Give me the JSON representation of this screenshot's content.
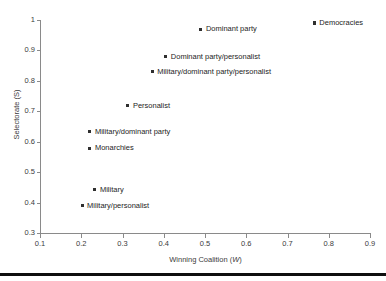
{
  "chart_data": {
    "type": "scatter",
    "title": "",
    "xlabel": "Winning Coalition (W)",
    "xlabel_plain": "Winning Coalition (",
    "xlabel_italic": "W",
    "xlabel_tail": ")",
    "ylabel": "Selectorate (S)",
    "xlim": [
      0.1,
      0.9
    ],
    "ylim": [
      0.3,
      1.0
    ],
    "xticks": [
      "0.1",
      "0.2",
      "0.3",
      "0.4",
      "0.5",
      "0.6",
      "0.7",
      "0.8",
      "0.9"
    ],
    "xtick_values": [
      0.1,
      0.2,
      0.3,
      0.4,
      0.5,
      0.6,
      0.7,
      0.8,
      0.9
    ],
    "yticks": [
      "0.3",
      "0.4",
      "0.5",
      "0.6",
      "0.7",
      "0.8",
      "0.9",
      "1"
    ],
    "ytick_values": [
      0.3,
      0.4,
      0.5,
      0.6,
      0.7,
      0.8,
      0.9,
      1.0
    ],
    "grid": false,
    "legend": "none",
    "marker_color": "#2f2f2f",
    "axis_color": "#8a8a8a",
    "points": [
      {
        "label": "Democracies",
        "x": 0.765,
        "y": 0.99
      },
      {
        "label": "Dominant party",
        "x": 0.49,
        "y": 0.97
      },
      {
        "label": "Dominant party/personalist",
        "x": 0.405,
        "y": 0.88
      },
      {
        "label": "Military/dominant party/personalist",
        "x": 0.372,
        "y": 0.83
      },
      {
        "label": "Personalist",
        "x": 0.313,
        "y": 0.718
      },
      {
        "label": "Military/dominant party",
        "x": 0.221,
        "y": 0.633
      },
      {
        "label": "Monarchies",
        "x": 0.221,
        "y": 0.578
      },
      {
        "label": "Military",
        "x": 0.233,
        "y": 0.443
      },
      {
        "label": "Military/personalist",
        "x": 0.202,
        "y": 0.39
      }
    ]
  }
}
